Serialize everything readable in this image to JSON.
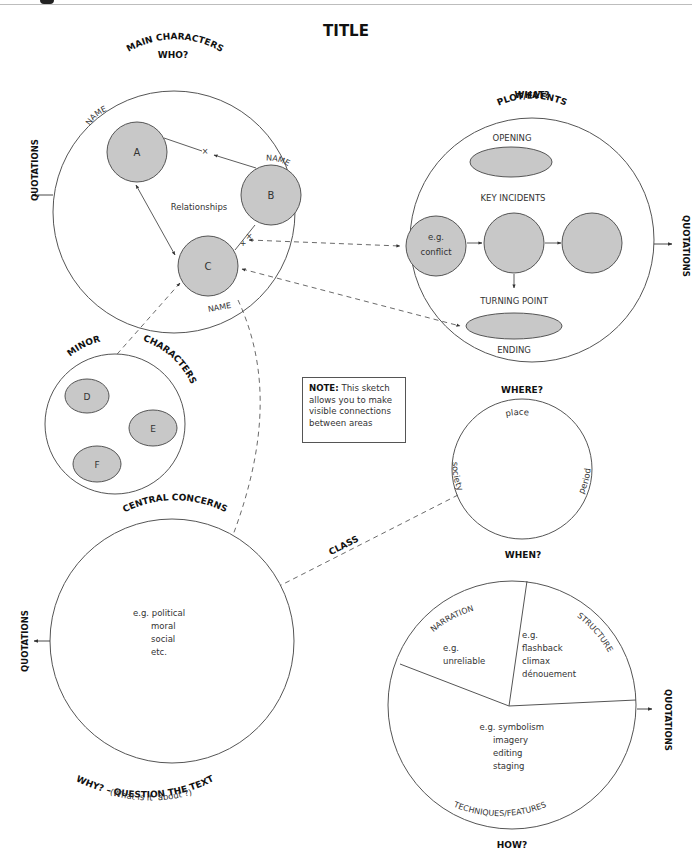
{
  "title": "TITLE",
  "note": {
    "label": "NOTE:",
    "text": "This sketch allows you to make visible connections between areas"
  },
  "main_characters": {
    "question": "WHO?",
    "heading": "MAIN CHARACTERS",
    "quotations": "QUOTATIONS",
    "relationships_label": "Relationships",
    "characters": [
      {
        "letter": "A",
        "name_label": "NAME"
      },
      {
        "letter": "B",
        "name_label": "NAME"
      },
      {
        "letter": "C",
        "name_label": "NAME"
      }
    ]
  },
  "plot": {
    "question": "WHAT?",
    "heading": "PLOT/EVENTS",
    "opening": "OPENING",
    "key_incidents": "KEY INCIDENTS",
    "incident_example_line1": "e.g.",
    "incident_example_line2": "conflict",
    "turning_point": "TURNING POINT",
    "ending": "ENDING",
    "quotations": "QUOTATIONS"
  },
  "minor_characters": {
    "heading_left": "MINOR",
    "heading_right": "CHARACTERS",
    "characters": [
      "D",
      "E",
      "F"
    ]
  },
  "setting": {
    "question_top": "WHERE?",
    "question_bottom": "WHEN?",
    "place": "place",
    "society": "society",
    "period": "period"
  },
  "connection_label": "CLASS",
  "central_concerns": {
    "heading": "CENTRAL CONCERNS",
    "quotations": "QUOTATIONS",
    "examples": [
      "e.g. political",
      "moral",
      "social",
      "etc."
    ],
    "question": "WHY? – QUESTION THE TEXT",
    "subtitle": "(What is it ‘about’?)"
  },
  "techniques": {
    "narration_label": "NARRATION",
    "narration_examples": [
      "e.g.",
      "unreliable"
    ],
    "structure_label": "STRUCTURE",
    "structure_examples": [
      "e.g.",
      "flashback",
      "climax",
      "dénouement"
    ],
    "features_examples": [
      "e.g. symbolism",
      "imagery",
      "editing",
      "staging"
    ],
    "heading": "TECHNIQUES/FEATURES",
    "question": "HOW?",
    "quotations": "QUOTATIONS"
  },
  "colors": {
    "fill_grey": "#c8c8c8",
    "stroke": "#555555",
    "text": "#333333",
    "heading": "#111111"
  }
}
